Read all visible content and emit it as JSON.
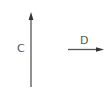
{
  "diagram": {
    "vectors": [
      {
        "label": "C",
        "direction": "up",
        "color": "#555555"
      },
      {
        "label": "D",
        "direction": "right",
        "color": "#555555"
      }
    ]
  }
}
